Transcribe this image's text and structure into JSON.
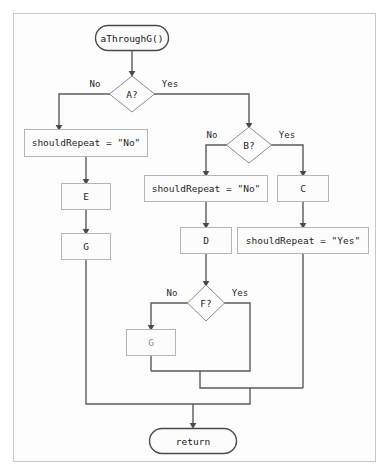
{
  "diagram": {
    "type": "flowchart",
    "colors": {
      "background": "#ffffff",
      "frame_fill": "#fdfdfd",
      "frame_stroke": "#c8c8c8",
      "box_fill": "#fcfcfc",
      "box_stroke": "#b4b4b4",
      "terminal_stroke": "#4a4a4a",
      "diamond_stroke": "#8c8c8c",
      "edge_stroke": "#5a5a5a",
      "text": "#1e1e1e",
      "text_faded": "#8e8e8e"
    },
    "nodes": {
      "start": {
        "label": "aThroughG()",
        "shape": "terminal"
      },
      "decision_a": {
        "label": "A?",
        "shape": "diamond"
      },
      "decision_b": {
        "label": "B?",
        "shape": "diamond"
      },
      "decision_f": {
        "label": "F?",
        "shape": "diamond"
      },
      "assign_no_left": {
        "label": "shouldRepeat = \"No\"",
        "shape": "process"
      },
      "assign_no_mid": {
        "label": "shouldRepeat = \"No\"",
        "shape": "process"
      },
      "assign_yes": {
        "label": "shouldRepeat = \"Yes\"",
        "shape": "process"
      },
      "process_e": {
        "label": "E",
        "shape": "process"
      },
      "process_g": {
        "label": "G",
        "shape": "process"
      },
      "process_c": {
        "label": "C",
        "shape": "process"
      },
      "process_d": {
        "label": "D",
        "shape": "process"
      },
      "process_faded": {
        "label": "G",
        "shape": "process",
        "faded": true
      },
      "end": {
        "label": "return",
        "shape": "terminal"
      }
    },
    "edge_labels": {
      "a_no": "No",
      "a_yes": "Yes",
      "b_no": "No",
      "b_yes": "Yes",
      "f_no": "No",
      "f_yes": "Yes"
    }
  }
}
